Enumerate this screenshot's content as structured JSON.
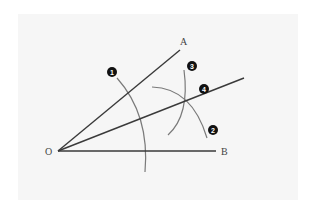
{
  "diagram": {
    "background": "#f6f6f6",
    "line_color": "#3a3a3a",
    "arc_color": "#7a7a7a",
    "badge_color": "#111111",
    "points": {
      "O": {
        "label": "O",
        "x": 58,
        "y": 151
      },
      "A": {
        "label": "A",
        "x": 180,
        "y": 50
      },
      "B": {
        "label": "B",
        "x": 216,
        "y": 151
      }
    },
    "rays": [
      {
        "name": "OA",
        "from": "O",
        "to": [
          180,
          50
        ]
      },
      {
        "name": "OB",
        "from": "O",
        "to": [
          216,
          151
        ]
      },
      {
        "name": "bisector",
        "from": "O",
        "to": [
          244,
          78
        ]
      }
    ],
    "steps": [
      {
        "number": "1",
        "label": "1",
        "description": "Arc centered at O crossing both rays"
      },
      {
        "number": "2",
        "label": "2",
        "description": "Arc from intersection on OB"
      },
      {
        "number": "3",
        "label": "3",
        "description": "Arc from intersection on OA"
      },
      {
        "number": "4",
        "label": "4",
        "description": "Draw bisector through arc intersection"
      }
    ]
  }
}
